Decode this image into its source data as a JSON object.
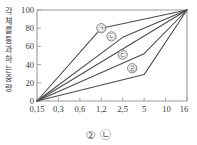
{
  "chart_data": {
    "type": "line",
    "title": "",
    "subtitle": "",
    "xlabel": "",
    "ylabel": "각 체를 통과하는 중량",
    "x_tick_labels": [
      "0,15",
      "0,3",
      "0,6",
      "1,2",
      "2,5",
      "5",
      "10",
      "16"
    ],
    "x_tick_values": [
      0.15,
      0.3,
      0.6,
      1.2,
      2.5,
      5,
      10,
      16
    ],
    "x_scale": "log-sieve",
    "y_tick_labels": [
      "0",
      "20",
      "40",
      "60",
      "80",
      "100"
    ],
    "y_tick_values": [
      0,
      20,
      40,
      60,
      80,
      100
    ],
    "ylim": [
      0,
      100
    ],
    "grid": false,
    "legend_position": "bottom",
    "series": [
      {
        "name": "㉠",
        "label_glyph": "㉠",
        "label_x": 1.2,
        "label_y": 80,
        "x": [
          0.15,
          1.2,
          16
        ],
        "values": [
          0,
          80,
          100
        ]
      },
      {
        "name": "㉡",
        "label_glyph": "㉡",
        "label_x": 1.7,
        "label_y": 71,
        "x": [
          0.15,
          2.5,
          16
        ],
        "values": [
          0,
          70,
          100
        ]
      },
      {
        "name": "㉢",
        "label_glyph": "㉢",
        "label_x": 2.5,
        "label_y": 51,
        "x": [
          0.15,
          5,
          16
        ],
        "values": [
          0,
          52,
          100
        ]
      },
      {
        "name": "㉣",
        "label_glyph": "㉣",
        "label_x": 3.4,
        "label_y": 36,
        "x": [
          0.15,
          5,
          16
        ],
        "values": [
          0,
          29,
          100
        ]
      },
      {
        "name": "baseline",
        "label_glyph": "",
        "label_x": null,
        "label_y": null,
        "x": [
          0.15,
          16
        ],
        "values": [
          0,
          100
        ]
      }
    ],
    "annotations": [
      {
        "text": "㉠",
        "x": 1.2,
        "y": 80
      },
      {
        "text": "㉡",
        "x": 1.7,
        "y": 71
      },
      {
        "text": "㉢",
        "x": 2.5,
        "y": 51
      },
      {
        "text": "㉣",
        "x": 3.4,
        "y": 36
      }
    ]
  },
  "axis": {
    "y_label": "각 체를 통과하는 중량",
    "y_ticks": [
      "100",
      "80",
      "60",
      "40",
      "20",
      "0"
    ],
    "x_ticks": [
      "0,15",
      "0,3",
      "0,6",
      "1,2",
      "2,5",
      "5",
      "10",
      "16"
    ]
  },
  "legend": {
    "items": [
      {
        "glyph": "②"
      },
      {
        "glyph": "㉡"
      }
    ]
  },
  "colors": {
    "curve": "#4a4a4a",
    "axis": "#9a9a9a",
    "text": "#3a3a3a",
    "background": "#ffffff"
  }
}
